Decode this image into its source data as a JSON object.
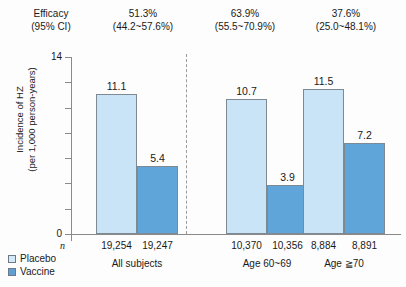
{
  "header": {
    "row_label_line1": "Efficacy",
    "row_label_line2": "(95% CI)",
    "cells": [
      {
        "value": "51.3%",
        "ci": "(44.2~57.6%)"
      },
      {
        "value": "63.9%",
        "ci": "(55.5~70.9%)"
      },
      {
        "value": "37.6%",
        "ci": "(25.0~48.1%)"
      }
    ]
  },
  "axis": {
    "y_title_line1": "Incidence of HZ",
    "y_title_line2": "(per 1,000 person-years)",
    "tick_top": "14",
    "tick_bottom": "0"
  },
  "bottom": {
    "n_symbol": "n",
    "legend": [
      {
        "label": "Placebo",
        "color": "#d4eaf8"
      },
      {
        "label": "Vaccine",
        "color": "#5f9fd6"
      }
    ]
  },
  "chart_data": {
    "type": "bar",
    "title": "",
    "xlabel": "",
    "ylabel": "Incidence of HZ (per 1,000 person-years)",
    "ylim": [
      0,
      14
    ],
    "ytick_labels": [
      "0",
      "14"
    ],
    "ytick_values": [
      0,
      2,
      4,
      6,
      8,
      10,
      12,
      14
    ],
    "grid": false,
    "legend_position": "bottom-left",
    "categories": [
      "All subjects",
      "Age 60~69",
      "Age ≧70"
    ],
    "series": [
      {
        "name": "Placebo",
        "color": "#c9e4f6",
        "values": [
          11.1,
          10.7,
          11.5
        ]
      },
      {
        "name": "Vaccine",
        "color": "#60a5da",
        "values": [
          5.4,
          3.9,
          7.2
        ]
      }
    ],
    "sample_sizes": [
      {
        "placebo": "19,254",
        "vaccine": "19,247"
      },
      {
        "placebo": "10,370",
        "vaccine": "10,356"
      },
      {
        "placebo": "8,884",
        "vaccine": "8,891"
      }
    ],
    "efficacy": [
      {
        "value": "51.3%",
        "ci": "(44.2~57.6%)"
      },
      {
        "value": "63.9%",
        "ci": "(55.5~70.9%)"
      },
      {
        "value": "37.6%",
        "ci": "(25.0~48.1%)"
      }
    ],
    "annotations": [
      "dashed divider between 'All subjects' and age subgroups"
    ]
  }
}
